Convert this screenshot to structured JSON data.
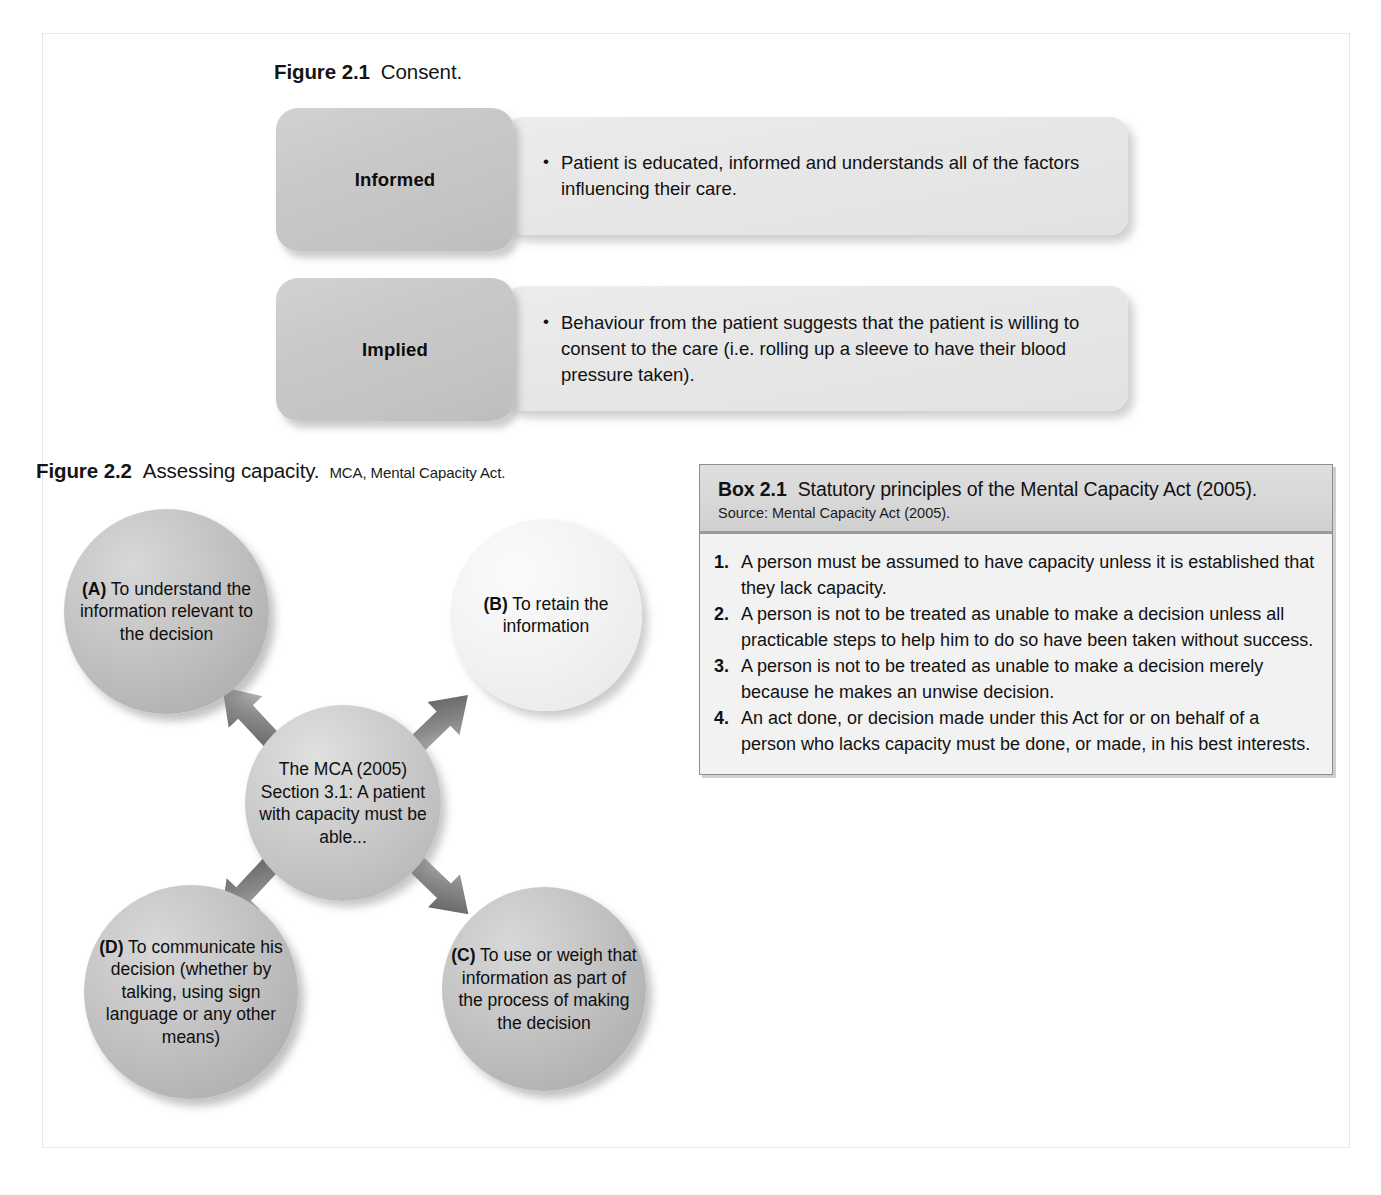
{
  "figure_2_1": {
    "caption": {
      "number": "Figure 2.1",
      "title": "Consent."
    },
    "rows": [
      {
        "label": "Informed",
        "bullet": "Patient is educated, informed and understands all of the factors influencing their care."
      },
      {
        "label": "Implied",
        "bullet": "Behaviour from the patient suggests that the patient is willing to consent to the care (i.e. rolling up a sleeve to have their blood pressure taken)."
      }
    ]
  },
  "figure_2_2": {
    "caption": {
      "number": "Figure 2.2",
      "title": "Assessing capacity.",
      "abbreviation": "MCA, Mental Capacity Act."
    },
    "center": {
      "text": "The MCA (2005) Section 3.1: A patient with capacity must be able..."
    },
    "nodes": [
      {
        "key": "A",
        "marker": "(A)",
        "text": " To understand the information relevant to the decision"
      },
      {
        "key": "B",
        "marker": "(B)",
        "text": " To retain the information"
      },
      {
        "key": "C",
        "marker": "(C)",
        "text": " To use or weigh that information as part of the process of making the decision"
      },
      {
        "key": "D",
        "marker": "(D)",
        "text": " To communicate his decision (whether by talking, using sign language or any other means)"
      }
    ]
  },
  "box_2_1": {
    "number": "Box 2.1",
    "title": "Statutory principles of the Mental Capacity Act (2005).",
    "source": "Source: Mental Capacity Act (2005).",
    "items": [
      "A person must be assumed to have capacity unless it is established that they lack capacity.",
      "A person is not to be treated as unable to make a decision unless all practicable steps to help him to do so have been taken without success.",
      "A person is not to be treated as unable to make a decision merely because he makes an unwise decision.",
      "An act done, or decision made under this Act for or on behalf of a person who lacks capacity must be done, or made, in his best interests."
    ]
  },
  "colors": {
    "page_background": "#ffffff",
    "frame_border": "#e6e6e8",
    "label_box_fill": "#c8c8c8",
    "body_box_fill": "#e8e8e8",
    "node_dark_fill": "#bdbdbd",
    "node_light_fill": "#f1f1f1",
    "arrow_fill": "#5a5a5a",
    "box_header_fill": "#d7d7d7",
    "box_body_fill": "#f2f2f2",
    "box_border": "#8e8e8e",
    "text": "#111111"
  }
}
